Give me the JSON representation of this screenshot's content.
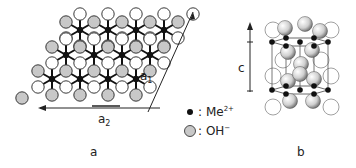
{
  "figure": {
    "panel_a": {
      "label": "a",
      "vector_a1": {
        "main": "a",
        "sub": "1"
      },
      "vector_a2": {
        "main": "a",
        "sub": "2"
      },
      "description": "Top view of a hydroxide layer: Me2+ cations (black dots) octahedrally coordinated by OH- anions (gray and open circles) in a hexagonal lattice"
    },
    "panel_b": {
      "label": "b",
      "vector_c": "c",
      "description": "Perspective view of the brucite-type unit cell stacking along c"
    },
    "legend": [
      {
        "symbol": "black-dot",
        "sep": ":",
        "text": "Me",
        "sup": "2+"
      },
      {
        "symbol": "gray-circle",
        "sep": ":",
        "text": "OH",
        "sup": "−"
      }
    ],
    "colors": {
      "metal": "#111111",
      "hydroxide_fill": "#c8c8c8",
      "open_circle_fill": "#ffffff",
      "stroke": "#222222"
    }
  }
}
